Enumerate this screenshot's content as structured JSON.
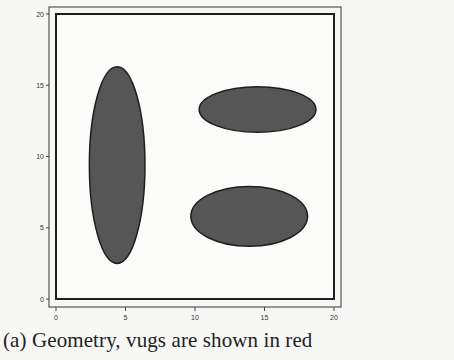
{
  "caption": "(a) Geometry, vugs are shown in red",
  "chart_data": {
    "type": "scatter",
    "title": "",
    "xlabel": "",
    "ylabel": "",
    "xlim": [
      0,
      20
    ],
    "ylim": [
      0,
      20
    ],
    "x_ticks": [
      "0",
      "5",
      "10",
      "15",
      "20"
    ],
    "y_ticks": [
      "0",
      "5",
      "10",
      "15",
      "20"
    ],
    "grid": false,
    "legend": null,
    "shapes": [
      {
        "name": "vug-1",
        "shape": "ellipse",
        "cx": 4.4,
        "cy": 9.4,
        "rx": 2.0,
        "ry": 6.9,
        "fill": "#555555"
      },
      {
        "name": "vug-2",
        "shape": "ellipse",
        "cx": 14.5,
        "cy": 13.3,
        "rx": 4.2,
        "ry": 1.6,
        "fill": "#555555"
      },
      {
        "name": "vug-3",
        "shape": "ellipse",
        "cx": 13.9,
        "cy": 5.8,
        "rx": 4.2,
        "ry": 2.1,
        "fill": "#555555"
      }
    ]
  },
  "colors": {
    "vug_fill": "#565656",
    "vug_stroke": "#1e1e1e",
    "frame": "#222222",
    "background": "#f7f7f5"
  }
}
